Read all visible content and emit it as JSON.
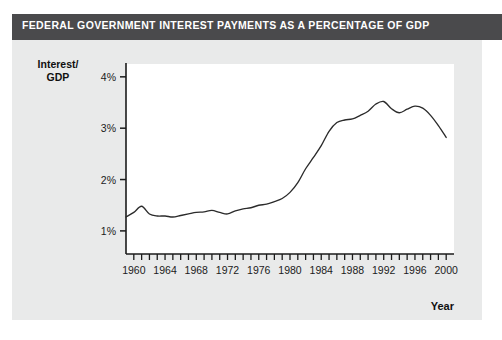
{
  "figure": {
    "title": "FEDERAL GOVERNMENT INTEREST PAYMENTS AS A PERCENTAGE OF GDP",
    "banner_color": "#4a4a4c",
    "card_color": "#e9eaea",
    "plot_color": "#ffffff",
    "line_color": "#2b2b2b",
    "axis_color": "#1b1b1b"
  },
  "chart_data": {
    "type": "line",
    "title": "FEDERAL GOVERNMENT INTEREST PAYMENTS AS A PERCENTAGE OF GDP",
    "xlabel": "Year",
    "ylabel": "Interest/\nGDP",
    "ylabel_line1": "Interest/",
    "ylabel_line2": "GDP",
    "xlim": [
      1959,
      2001
    ],
    "ylim": [
      0.55,
      4.25
    ],
    "grid": false,
    "legend": null,
    "ytick_labels": [
      "1%",
      "2%",
      "3%",
      "4%"
    ],
    "ytick_values": [
      1,
      2,
      3,
      4
    ],
    "xtick_labels": [
      "1960",
      "1964",
      "1968",
      "1972",
      "1976",
      "1980",
      "1984",
      "1988",
      "1992",
      "1996",
      "2000"
    ],
    "xtick_values": [
      1960,
      1964,
      1968,
      1972,
      1976,
      1980,
      1984,
      1988,
      1992,
      1996,
      2000
    ],
    "xminor_step": 1,
    "series": [
      {
        "name": "Interest payments as % of GDP",
        "x": [
          1959,
          1960,
          1961,
          1962,
          1963,
          1964,
          1965,
          1966,
          1967,
          1968,
          1969,
          1970,
          1971,
          1972,
          1973,
          1974,
          1975,
          1976,
          1977,
          1978,
          1979,
          1980,
          1981,
          1982,
          1983,
          1984,
          1985,
          1986,
          1987,
          1988,
          1989,
          1990,
          1991,
          1992,
          1993,
          1994,
          1995,
          1996,
          1997,
          1998,
          1999,
          2000
        ],
        "values": [
          1.27,
          1.36,
          1.48,
          1.33,
          1.29,
          1.29,
          1.27,
          1.3,
          1.33,
          1.36,
          1.37,
          1.4,
          1.36,
          1.33,
          1.39,
          1.43,
          1.45,
          1.5,
          1.52,
          1.57,
          1.63,
          1.75,
          1.94,
          2.21,
          2.43,
          2.66,
          2.94,
          3.11,
          3.16,
          3.18,
          3.25,
          3.33,
          3.47,
          3.52,
          3.38,
          3.3,
          3.37,
          3.43,
          3.39,
          3.25,
          3.05,
          2.82
        ]
      }
    ]
  }
}
